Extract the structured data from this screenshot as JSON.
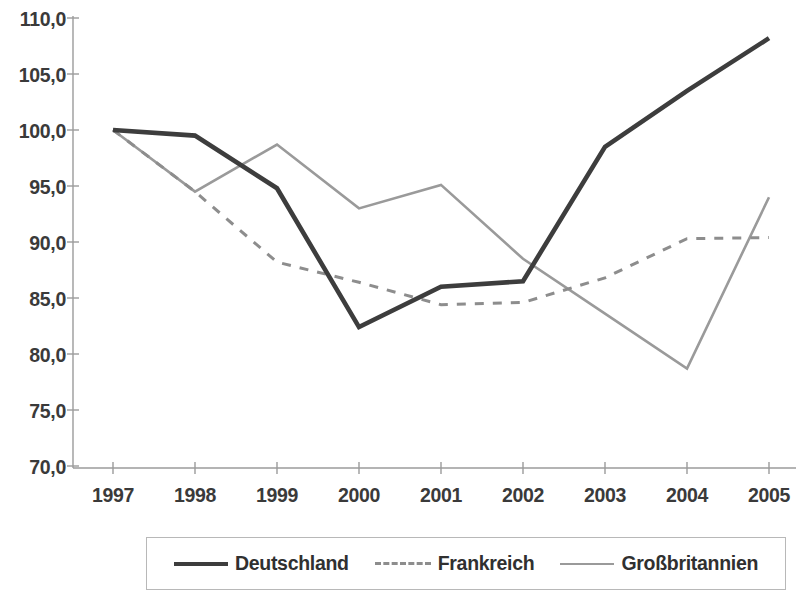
{
  "chart_data": {
    "type": "line",
    "title": "",
    "subtitle": "",
    "xlabel": "",
    "ylabel": "",
    "categories": [
      "1997",
      "1998",
      "1999",
      "2000",
      "2001",
      "2002",
      "2003",
      "2004",
      "2005"
    ],
    "x": [
      1997,
      1998,
      1999,
      2000,
      2001,
      2002,
      2003,
      2004,
      2005
    ],
    "ylim": [
      70.0,
      110.0
    ],
    "ytick_labels": [
      "110,0",
      "105,0",
      "100,0",
      "95,0",
      "90,0",
      "85,0",
      "80,0",
      "75,0",
      "70,0"
    ],
    "ytick_values": [
      110.0,
      105.0,
      100.0,
      95.0,
      90.0,
      85.0,
      80.0,
      75.0,
      70.0
    ],
    "grid": false,
    "legend_position": "bottom",
    "series": [
      {
        "name": "Deutschland",
        "style": "solid-thick",
        "color": "#3d3d3d",
        "values": [
          100.0,
          99.5,
          94.8,
          82.4,
          86.0,
          86.5,
          98.5,
          103.5,
          108.2
        ]
      },
      {
        "name": "Frankreich",
        "style": "dashed",
        "color": "#8d8d8d",
        "values": [
          100.0,
          94.5,
          88.2,
          86.4,
          84.4,
          84.6,
          86.8,
          90.3,
          90.4
        ]
      },
      {
        "name": "Großbritannien",
        "style": "solid-thin",
        "color": "#9a9a9a",
        "values": [
          100.0,
          94.5,
          98.7,
          93.0,
          95.1,
          88.5,
          83.6,
          78.7,
          94.0
        ]
      }
    ]
  },
  "legend": {
    "items": [
      {
        "label": "Deutschland"
      },
      {
        "label": "Frankreich"
      },
      {
        "label": "Großbritannien"
      }
    ]
  }
}
